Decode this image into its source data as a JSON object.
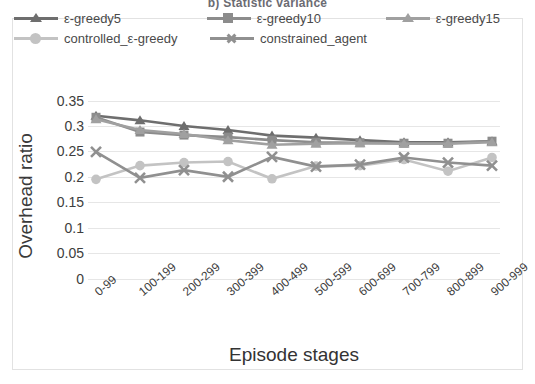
{
  "caption": "b) Statistic variance",
  "axes": {
    "ylabel": "Overhead ratio",
    "xlabel": "Episode stages",
    "yticks": [
      "0.35",
      "0.3",
      "0.25",
      "0.2",
      "0.15",
      "0.1",
      "0.05",
      "0"
    ]
  },
  "legend": [
    {
      "label": "ε-greedy5",
      "marker": "triangle",
      "color": "#6e6e6e"
    },
    {
      "label": "ε-greedy10",
      "marker": "square",
      "color": "#8c8c8c"
    },
    {
      "label": "ε-greedy15",
      "marker": "triangle",
      "color": "#a0a0a0"
    },
    {
      "label": "controlled_ε-greedy",
      "marker": "circle",
      "color": "#c3c3c3"
    },
    {
      "label": "constrained_agent",
      "marker": "x",
      "color": "#909090"
    }
  ],
  "chart_data": {
    "type": "line",
    "title": "b) Statistic variance",
    "xlabel": "Episode stages",
    "ylabel": "Overhead ratio",
    "ylim": [
      0,
      0.35
    ],
    "ytick_step": 0.05,
    "grid": true,
    "legend_position": "top",
    "categories": [
      "0-99",
      "100-199",
      "200-299",
      "300-399",
      "400-499",
      "500-599",
      "600-699",
      "700-799",
      "800-899",
      "900-999"
    ],
    "series": [
      {
        "name": "ε-greedy5",
        "marker": "triangle",
        "color": "#6e6e6e",
        "values": [
          0.32,
          0.311,
          0.3,
          0.292,
          0.281,
          0.277,
          0.272,
          0.268,
          0.268,
          0.27
        ]
      },
      {
        "name": "ε-greedy10",
        "marker": "square",
        "color": "#8c8c8c",
        "values": [
          0.317,
          0.288,
          0.282,
          0.278,
          0.272,
          0.268,
          0.267,
          0.266,
          0.266,
          0.27
        ]
      },
      {
        "name": "ε-greedy15",
        "marker": "triangle",
        "color": "#a0a0a0",
        "values": [
          0.313,
          0.292,
          0.284,
          0.272,
          0.263,
          0.265,
          0.266,
          0.265,
          0.265,
          0.268
        ]
      },
      {
        "name": "controlled_ε-greedy",
        "marker": "circle",
        "color": "#c3c3c3",
        "values": [
          0.195,
          0.222,
          0.228,
          0.23,
          0.196,
          0.221,
          0.222,
          0.234,
          0.211,
          0.238
        ]
      },
      {
        "name": "constrained_agent",
        "marker": "x",
        "color": "#909090",
        "values": [
          0.249,
          0.198,
          0.213,
          0.2,
          0.239,
          0.22,
          0.224,
          0.238,
          0.228,
          0.222
        ]
      }
    ]
  }
}
